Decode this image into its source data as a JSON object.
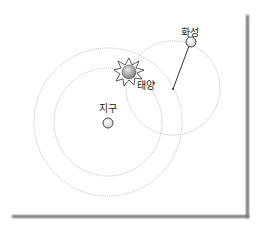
{
  "diagram": {
    "labels": {
      "mars": "화성",
      "sun": "태양",
      "earth": "지구"
    },
    "colors": {
      "background": "#ffffff",
      "orbit_stroke": "#b8b8b8",
      "frame_shadow": "#7a7a7a",
      "line": "#333333",
      "planet_fill": "#f4f4f4",
      "sun_fill": "#9a9a9a"
    }
  }
}
